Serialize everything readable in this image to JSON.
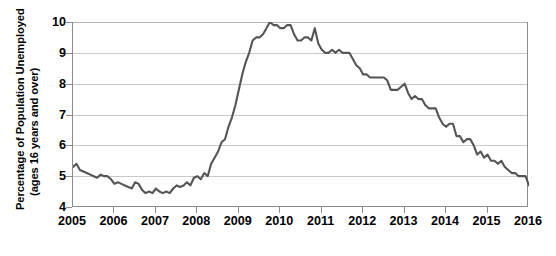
{
  "chart_data": {
    "type": "line",
    "title": "",
    "xlabel": "",
    "ylabel": "Percentage of Population Unemployed (ages 16 years and over)",
    "ylabel_line1": "Percentage of Population Unemployed",
    "ylabel_line2": "(ages 16 years and over)",
    "xlim": [
      2005.0,
      2016.0
    ],
    "ylim": [
      4,
      10
    ],
    "yticks": [
      4,
      5,
      6,
      7,
      8,
      9,
      10
    ],
    "ytick_labels": [
      "4",
      "5",
      "6",
      "7",
      "8",
      "9",
      "10"
    ],
    "xticks": [
      2005,
      2006,
      2007,
      2008,
      2009,
      2010,
      2011,
      2012,
      2013,
      2014,
      2015,
      2016
    ],
    "xtick_labels": [
      "2005",
      "2006",
      "2007",
      "2008",
      "2009",
      "2010",
      "2011",
      "2012",
      "2013",
      "2014",
      "2015",
      "2016"
    ],
    "grid": "horizontal",
    "legend": "none",
    "line_color": "#555555",
    "line_width": 2.1,
    "series": [
      {
        "name": "Unemployment rate",
        "x": [
          2005.0,
          2005.083,
          2005.167,
          2005.25,
          2005.333,
          2005.417,
          2005.5,
          2005.583,
          2005.667,
          2005.75,
          2005.833,
          2005.917,
          2006.0,
          2006.083,
          2006.167,
          2006.25,
          2006.333,
          2006.417,
          2006.5,
          2006.583,
          2006.667,
          2006.75,
          2006.833,
          2006.917,
          2007.0,
          2007.083,
          2007.167,
          2007.25,
          2007.333,
          2007.417,
          2007.5,
          2007.583,
          2007.667,
          2007.75,
          2007.833,
          2007.917,
          2008.0,
          2008.083,
          2008.167,
          2008.25,
          2008.333,
          2008.417,
          2008.5,
          2008.583,
          2008.667,
          2008.75,
          2008.833,
          2008.917,
          2009.0,
          2009.083,
          2009.167,
          2009.25,
          2009.333,
          2009.417,
          2009.5,
          2009.583,
          2009.667,
          2009.75,
          2009.833,
          2009.917,
          2010.0,
          2010.083,
          2010.167,
          2010.25,
          2010.333,
          2010.417,
          2010.5,
          2010.583,
          2010.667,
          2010.75,
          2010.833,
          2010.917,
          2011.0,
          2011.083,
          2011.167,
          2011.25,
          2011.333,
          2011.417,
          2011.5,
          2011.583,
          2011.667,
          2011.75,
          2011.833,
          2011.917,
          2012.0,
          2012.083,
          2012.167,
          2012.25,
          2012.333,
          2012.417,
          2012.5,
          2012.583,
          2012.667,
          2012.75,
          2012.833,
          2012.917,
          2013.0,
          2013.083,
          2013.167,
          2013.25,
          2013.333,
          2013.417,
          2013.5,
          2013.583,
          2013.667,
          2013.75,
          2013.833,
          2013.917,
          2014.0,
          2014.083,
          2014.167,
          2014.25,
          2014.333,
          2014.417,
          2014.5,
          2014.583,
          2014.667,
          2014.75,
          2014.833,
          2014.917,
          2015.0,
          2015.083,
          2015.167,
          2015.25,
          2015.333,
          2015.417,
          2015.5,
          2015.583,
          2015.667,
          2015.75,
          2015.833,
          2015.917,
          2016.0
        ],
        "values": [
          5.3,
          5.4,
          5.2,
          5.15,
          5.1,
          5.05,
          5.0,
          4.95,
          5.05,
          5.0,
          5.0,
          4.9,
          4.75,
          4.8,
          4.75,
          4.7,
          4.65,
          4.6,
          4.8,
          4.75,
          4.55,
          4.45,
          4.5,
          4.45,
          4.6,
          4.5,
          4.45,
          4.5,
          4.45,
          4.6,
          4.7,
          4.65,
          4.7,
          4.8,
          4.7,
          4.95,
          5.0,
          4.9,
          5.1,
          5.0,
          5.4,
          5.6,
          5.8,
          6.1,
          6.2,
          6.6,
          6.9,
          7.3,
          7.8,
          8.3,
          8.7,
          9.0,
          9.4,
          9.5,
          9.5,
          9.6,
          9.8,
          10.0,
          9.9,
          9.9,
          9.8,
          9.8,
          9.9,
          9.9,
          9.6,
          9.4,
          9.4,
          9.5,
          9.5,
          9.4,
          9.8,
          9.3,
          9.1,
          9.0,
          9.0,
          9.1,
          9.0,
          9.1,
          9.0,
          9.0,
          9.0,
          8.8,
          8.6,
          8.5,
          8.3,
          8.3,
          8.2,
          8.2,
          8.2,
          8.2,
          8.2,
          8.1,
          7.8,
          7.8,
          7.8,
          7.9,
          8.0,
          7.7,
          7.5,
          7.6,
          7.5,
          7.5,
          7.3,
          7.2,
          7.2,
          7.2,
          6.9,
          6.7,
          6.6,
          6.7,
          6.7,
          6.3,
          6.3,
          6.1,
          6.2,
          6.2,
          6.0,
          5.7,
          5.8,
          5.6,
          5.7,
          5.5,
          5.5,
          5.4,
          5.5,
          5.3,
          5.2,
          5.1,
          5.1,
          5.0,
          5.0,
          5.0,
          4.7
        ]
      }
    ]
  },
  "footnote": ""
}
